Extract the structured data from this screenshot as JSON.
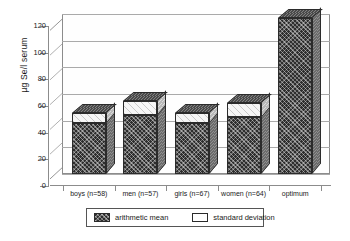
{
  "chart_data": {
    "type": "bar",
    "title": "",
    "subtitle": "",
    "xlabel": "",
    "ylabel": "µg Se/l serum",
    "ylim": [
      0,
      120
    ],
    "yticks": [
      0,
      20,
      40,
      60,
      80,
      100,
      120
    ],
    "grid": true,
    "stacked": true,
    "three_d": true,
    "legend_position": "bottom",
    "categories": [
      "boys (n=58)",
      "men (n=57)",
      "girls (n=67)",
      "women (n=64)",
      "optimum"
    ],
    "series": [
      {
        "name": "arithmetic mean",
        "values": [
          38,
          44,
          38,
          43,
          117
        ]
      },
      {
        "name": "standard deviation",
        "values": [
          8,
          11,
          8,
          10,
          0
        ]
      }
    ],
    "totals": [
      46,
      55,
      46,
      53,
      117
    ],
    "colors": {
      "arithmetic_mean": "#2e2e2e",
      "standard_deviation": "#ffffff",
      "axis": "#8c8c8c",
      "grid": "#aaaaaa",
      "background": "#ffffff"
    }
  },
  "legend": {
    "items": [
      {
        "label": "arithmetic mean",
        "swatch": "mean"
      },
      {
        "label": "standard deviation",
        "swatch": "sd"
      }
    ]
  },
  "axis": {
    "y_title": "µg Se/l serum",
    "y_tick_labels": [
      "120",
      "100",
      "80",
      "60",
      "40",
      "20",
      "0"
    ]
  }
}
